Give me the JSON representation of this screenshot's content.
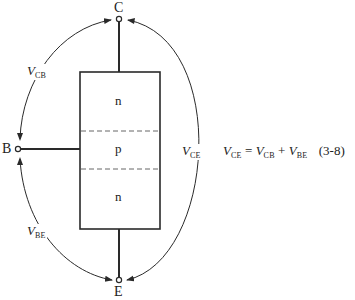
{
  "diagram": {
    "terminals": {
      "collector": "C",
      "base": "B",
      "emitter": "E"
    },
    "regions": [
      {
        "label": "n",
        "role": "collector-region"
      },
      {
        "label": "p",
        "role": "base-region"
      },
      {
        "label": "n",
        "role": "emitter-region"
      }
    ],
    "voltages": {
      "vcb": {
        "symbol": "V",
        "subscript": "CB"
      },
      "vbe": {
        "symbol": "V",
        "subscript": "BE"
      },
      "vce": {
        "symbol": "V",
        "subscript": "CE"
      }
    },
    "equation": {
      "lhs_symbol": "V",
      "lhs_sub": "CE",
      "equals": "=",
      "term1_symbol": "V",
      "term1_sub": "CB",
      "plus": "+",
      "term2_symbol": "V",
      "term2_sub": "BE",
      "number": "(3-8)"
    },
    "colors": {
      "line": "#2a2a2a",
      "dash": "#555555",
      "background": "#ffffff"
    }
  }
}
